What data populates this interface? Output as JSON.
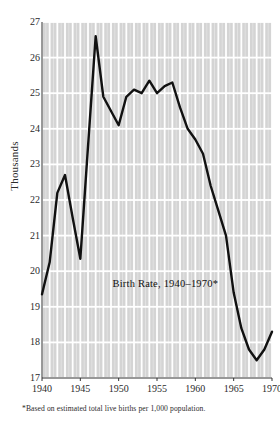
{
  "chart_data": {
    "type": "line",
    "title": "Birth Rate, 1940–1970*",
    "xlabel": "",
    "ylabel": "Thousands",
    "footnote": "*Based on estimated total live births per 1,000 population.",
    "xlim": [
      1940,
      1970
    ],
    "ylim": [
      17,
      27
    ],
    "grid": true,
    "legend": "none",
    "x_ticks": [
      1940,
      1945,
      1950,
      1955,
      1960,
      1965,
      1970
    ],
    "x_tick_labels": [
      "1940",
      "1945",
      "1950",
      "1955",
      "1960",
      "1965",
      "1970"
    ],
    "y_ticks": [
      17,
      18,
      19,
      20,
      21,
      22,
      23,
      24,
      25,
      26,
      27
    ],
    "y_tick_labels": [
      "17",
      "18",
      "19",
      "20",
      "21",
      "22",
      "23",
      "24",
      "25",
      "26",
      "27"
    ],
    "x": [
      1940,
      1941,
      1942,
      1943,
      1944,
      1945,
      1946,
      1947,
      1948,
      1949,
      1950,
      1951,
      1952,
      1953,
      1954,
      1955,
      1956,
      1957,
      1958,
      1959,
      1960,
      1961,
      1962,
      1963,
      1964,
      1965,
      1966,
      1967,
      1968,
      1969,
      1970
    ],
    "values": [
      19.35,
      20.25,
      22.2,
      22.7,
      21.5,
      20.35,
      23.5,
      26.6,
      24.9,
      24.5,
      24.1,
      24.9,
      25.1,
      25.0,
      25.35,
      25.0,
      25.2,
      25.3,
      24.6,
      24.0,
      23.7,
      23.3,
      22.4,
      21.7,
      21.0,
      19.4,
      18.4,
      17.8,
      17.5,
      17.8,
      18.3
    ],
    "series_color": "#111111",
    "grid_color": "#d4d4d4",
    "background": "#ffffff"
  }
}
